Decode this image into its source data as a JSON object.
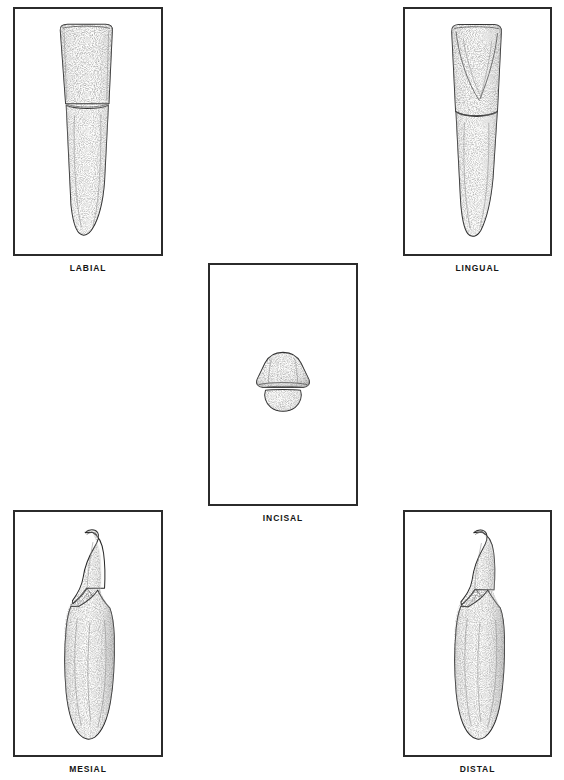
{
  "plate": {
    "subject": "mandibular incisor",
    "background_color": "#ffffff",
    "ink_color": "#272727",
    "frame_color": "#2b2b2b",
    "views": [
      {
        "id": "labial",
        "caption": "LABIAL",
        "position": "top-left",
        "description": "Labial aspect: trapezoidal crown widest at the incisal edge, tapering to a narrow cervix; single tapering root with a rounded apex."
      },
      {
        "id": "lingual",
        "caption": "LINGUAL",
        "position": "top-right",
        "description": "Lingual aspect: crown narrower than labial with marginal ridges converging to a shallow lingual fossa; root tapers and deviates distally."
      },
      {
        "id": "incisal",
        "caption": "INCISAL",
        "position": "center",
        "description": "Incisal aspect: rounded triangular outline, broad labial surface above and narrower lingual lobe below, separated by the incisal edge."
      },
      {
        "id": "mesial",
        "caption": "MESIAL",
        "position": "bottom-left",
        "description": "Mesial aspect: wedge-shaped crown with a pointed incisal edge curving lingually; V-shaped cervical line; long, broad root with a developmental depression."
      },
      {
        "id": "distal",
        "caption": "DISTAL",
        "position": "bottom-right",
        "description": "Distal aspect: wedge-shaped crown mirroring the mesial view with the incisal tip inclined lingually; cervical line less curved; root with a longitudinal groove."
      }
    ]
  }
}
